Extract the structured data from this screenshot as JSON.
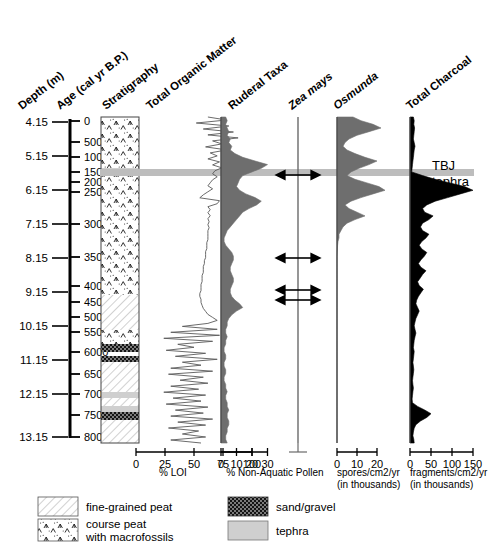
{
  "figure": {
    "tephra_label_line1": "TBJ",
    "tephra_label_line2": "tephra"
  },
  "columns": {
    "depth": "Depth (m)",
    "age": "Age (cal yr B.P.)",
    "stratigraphy": "Stratigraphy",
    "organic": "Total Organic Matter",
    "ruderal": "Ruderal Taxa",
    "zea": "Zea mays",
    "osmunda": "Osmunda",
    "charcoal": "Total Charcoal"
  },
  "axis_labels": {
    "loi": "% LOI",
    "pollen": "% Non-Aquatic Pollen",
    "spores_1": "spores/cm2/yr",
    "spores_2": "(in thousands)",
    "fragments_1": "fragments/cm2/yr",
    "fragments_2": "(in thousands)"
  },
  "legend": [
    {
      "label": "fine-grained peat",
      "pattern": "diagonal-hatch"
    },
    {
      "label": "course peat\nwith macrofossils",
      "label_line1": "course peat",
      "label_line2": "with macrofossils",
      "pattern": "macrofossil-chevrons"
    },
    {
      "label": "sand/gravel",
      "pattern": "dense-dots-dark"
    },
    {
      "label": "tephra",
      "pattern": "solid-gray"
    }
  ],
  "chart_data": {
    "type": "line",
    "orientation": "vertical-depth",
    "ylabel": "Depth (m) / Age (cal yr B.P.)",
    "depth_axis": {
      "label": "Depth (m)",
      "ticks": [
        4.15,
        5.15,
        6.15,
        7.15,
        8.15,
        9.15,
        10.15,
        11.15,
        12.15,
        13.15
      ],
      "tick_labels": [
        "4.15",
        "5.15",
        "6.15",
        "7.15",
        "8.15",
        "9.15",
        "10.15",
        "11.15",
        "12.15",
        "13.15"
      ],
      "y_px": [
        122,
        156,
        190,
        224,
        258,
        292,
        326,
        360,
        394,
        437
      ]
    },
    "age_axis": {
      "label": "Age (cal yr B.P.)",
      "ticks": [
        0,
        500,
        1000,
        1500,
        2000,
        2500,
        3000,
        3500,
        4000,
        4500,
        5000,
        5500,
        6000,
        6500,
        7000,
        7500,
        8000
      ],
      "tick_labels": [
        "0",
        "500",
        "1000",
        "1500",
        "2000",
        "2500",
        "3000",
        "3500",
        "4000",
        "4500",
        "5000",
        "5500",
        "6000",
        "6500",
        "7000",
        "7500",
        "8000"
      ],
      "y_px": [
        121,
        142,
        157,
        172,
        182,
        192,
        224,
        257,
        286,
        302,
        317,
        332,
        352,
        374,
        394,
        415,
        437
      ]
    },
    "tephra_marker": {
      "name": "TBJ tephra",
      "y_px": 173,
      "age_cal_yr_bp": 1500,
      "depth_m": 5.95
    },
    "stratigraphy_units": [
      {
        "unit": "course peat with macrofossils",
        "top_px": 117,
        "bottom_px": 168
      },
      {
        "unit": "tephra",
        "top_px": 168,
        "bottom_px": 176
      },
      {
        "unit": "course peat with macrofossils",
        "top_px": 176,
        "bottom_px": 295
      },
      {
        "unit": "fine-grained peat",
        "top_px": 295,
        "bottom_px": 330
      },
      {
        "unit": "course peat with macrofossils",
        "top_px": 330,
        "bottom_px": 344
      },
      {
        "unit": "sand/gravel",
        "top_px": 344,
        "bottom_px": 352
      },
      {
        "unit": "sand/gravel",
        "top_px": 356,
        "bottom_px": 362
      },
      {
        "unit": "fine-grained peat",
        "top_px": 362,
        "bottom_px": 392
      },
      {
        "unit": "tephra",
        "top_px": 392,
        "bottom_px": 398
      },
      {
        "unit": "fine-grained peat",
        "top_px": 398,
        "bottom_px": 406
      },
      {
        "unit": "tephra",
        "top_px": 406,
        "bottom_px": 412
      },
      {
        "unit": "sand/gravel",
        "top_px": 412,
        "bottom_px": 420
      },
      {
        "unit": "fine-grained peat",
        "top_px": 420,
        "bottom_px": 443
      }
    ],
    "series": [
      {
        "name": "Total Organic Matter",
        "unit": "% LOI",
        "style": "line",
        "color": "#666666",
        "xlim": [
          0,
          100
        ],
        "xticks": [
          0,
          25,
          50,
          75,
          100
        ],
        "xtick_labels": [
          "0",
          "25",
          "50",
          "75",
          "100"
        ],
        "x0_px": 136,
        "x_scale_px_per_unit": 1.16,
        "values_pct": [
          62,
          78,
          52,
          80,
          58,
          84,
          62,
          88,
          66,
          74,
          60,
          78,
          64,
          70,
          62,
          72,
          66,
          74,
          68,
          66,
          70,
          66,
          64,
          62,
          66,
          62,
          58,
          55,
          72,
          70,
          62,
          64,
          62,
          64,
          62,
          63,
          62,
          63,
          62,
          62,
          62,
          62,
          61,
          61,
          61,
          60,
          60,
          60,
          59,
          59,
          58,
          58,
          58,
          57,
          57,
          57,
          56,
          56,
          56,
          55,
          55,
          56,
          56,
          57,
          58,
          60,
          62,
          66,
          70,
          62,
          40,
          70,
          30,
          72,
          24,
          66,
          36,
          50,
          26,
          60,
          34,
          70,
          40,
          56,
          30,
          66,
          28,
          58,
          38,
          62,
          30,
          54,
          24,
          60,
          32,
          56,
          26,
          62,
          34,
          58,
          30,
          66,
          36,
          60,
          28,
          54,
          40,
          60,
          30,
          56
        ]
      },
      {
        "name": "Ruderal Taxa",
        "unit": "% Non-Aquatic Pollen",
        "style": "silhouette-filled",
        "color": "#6e6e6e",
        "xlim": [
          0,
          35
        ],
        "xticks": [
          0,
          10,
          20,
          30
        ],
        "xtick_labels": [
          "0",
          "10",
          "20",
          "30"
        ],
        "x0_px": 221,
        "x_scale_px_per_unit": 1.55,
        "values_pct": [
          3,
          4,
          3,
          4,
          5,
          4,
          6,
          5,
          7,
          6,
          9,
          14,
          22,
          30,
          26,
          20,
          14,
          12,
          11,
          10,
          12,
          16,
          22,
          26,
          23,
          18,
          14,
          12,
          10,
          8,
          6,
          4,
          3,
          2,
          2,
          3,
          5,
          7,
          8,
          8,
          7,
          6,
          6,
          7,
          8,
          8,
          7,
          6,
          6,
          7,
          9,
          12,
          14,
          10,
          7,
          5,
          4,
          4,
          3,
          3,
          4,
          3,
          3,
          2,
          2,
          3,
          3,
          2,
          2,
          3,
          3,
          2,
          2,
          3,
          3,
          4,
          3,
          3,
          4,
          4,
          5,
          4,
          4,
          5,
          5,
          4,
          4,
          3,
          3,
          4
        ]
      },
      {
        "name": "Zea mays",
        "unit": "% Non-Aquatic Pollen",
        "style": "presence-arrows",
        "color": "#555555",
        "baseline_x_px": 298,
        "presence_markers_y_px": [
          175,
          258,
          290,
          300
        ],
        "note": "double-headed horizontal arrows indicate presence occurrences"
      },
      {
        "name": "Osmunda",
        "unit": "spores/cm2/yr (in thousands)",
        "style": "silhouette-filled",
        "color": "#6e6e6e",
        "xlim": [
          0,
          25
        ],
        "xticks": [
          0,
          10,
          20
        ],
        "xtick_labels": [
          "0",
          "10",
          "20"
        ],
        "x0_px": 337,
        "x_scale_px_per_unit": 2.0,
        "values": [
          8,
          12,
          18,
          22,
          16,
          10,
          6,
          4,
          3,
          5,
          9,
          14,
          20,
          16,
          11,
          7,
          5,
          9,
          15,
          21,
          24,
          18,
          12,
          7,
          4,
          6,
          10,
          14,
          9,
          5,
          3,
          2,
          1,
          1,
          0.5,
          0.3,
          0.2,
          0.1,
          0,
          0,
          0,
          0,
          0,
          0,
          0,
          0,
          0,
          0,
          0,
          0,
          0,
          0,
          0,
          0,
          0,
          0,
          0,
          0,
          0,
          0,
          0,
          0,
          0,
          0,
          0,
          0,
          0,
          0,
          0,
          0,
          0,
          0,
          0,
          0,
          0,
          0,
          0,
          0,
          0,
          0,
          0,
          0,
          0,
          0,
          0,
          0,
          0,
          0,
          0,
          0
        ]
      },
      {
        "name": "Total Charcoal",
        "unit": "fragments/cm2/yr (in thousands)",
        "style": "silhouette-filled",
        "color": "#000000",
        "xlim": [
          0,
          175
        ],
        "xticks": [
          0,
          50,
          100,
          150
        ],
        "xtick_labels": [
          "0",
          "50",
          "100",
          "150"
        ],
        "x0_px": 410,
        "x_scale_px_per_unit": 0.42,
        "values": [
          8,
          10,
          9,
          11,
          10,
          9,
          8,
          10,
          12,
          10,
          9,
          8,
          7,
          6,
          5,
          4,
          30,
          60,
          95,
          130,
          150,
          120,
          90,
          60,
          40,
          30,
          35,
          55,
          45,
          30,
          25,
          30,
          45,
          38,
          28,
          22,
          28,
          40,
          34,
          26,
          20,
          26,
          38,
          30,
          24,
          18,
          22,
          32,
          26,
          20,
          16,
          14,
          18,
          22,
          18,
          14,
          12,
          10,
          12,
          14,
          12,
          10,
          9,
          8,
          10,
          9,
          8,
          7,
          8,
          9,
          8,
          7,
          6,
          7,
          8,
          7,
          6,
          5,
          6,
          18,
          35,
          50,
          40,
          25,
          14,
          10,
          8,
          7,
          9,
          10
        ]
      }
    ]
  }
}
